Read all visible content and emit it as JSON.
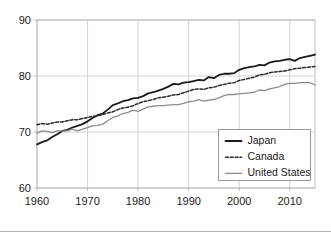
{
  "chart_data": {
    "type": "line",
    "title": "",
    "subtitle": "",
    "xlabel": "",
    "ylabel": "",
    "xlim": [
      1960,
      2015
    ],
    "ylim": [
      60,
      90
    ],
    "xticks": [
      1960,
      1970,
      1980,
      1990,
      2000,
      2010
    ],
    "yticks": [
      60,
      70,
      80,
      90
    ],
    "xtick_labels": [
      "1960",
      "1970",
      "1980",
      "1990",
      "2000",
      "2010"
    ],
    "ytick_labels": [
      "60",
      "70",
      "80",
      "90"
    ],
    "grid": true,
    "grid_axes": "both",
    "legend_position": "lower-right",
    "x": [
      1960,
      1961,
      1962,
      1963,
      1964,
      1965,
      1966,
      1967,
      1968,
      1969,
      1970,
      1971,
      1972,
      1973,
      1974,
      1975,
      1976,
      1977,
      1978,
      1979,
      1980,
      1981,
      1982,
      1983,
      1984,
      1985,
      1986,
      1987,
      1988,
      1989,
      1990,
      1991,
      1992,
      1993,
      1994,
      1995,
      1996,
      1997,
      1998,
      1999,
      2000,
      2001,
      2002,
      2003,
      2004,
      2005,
      2006,
      2007,
      2008,
      2009,
      2010,
      2011,
      2012,
      2013,
      2014,
      2015
    ],
    "series": [
      {
        "name": "Japan",
        "style": "solid",
        "color": "#1a1a1a",
        "width": 1.8,
        "values": [
          67.8,
          68.2,
          68.5,
          69.1,
          69.6,
          70.2,
          70.4,
          70.8,
          71.1,
          71.4,
          71.9,
          72.5,
          73.0,
          73.3,
          74.0,
          74.8,
          75.1,
          75.5,
          75.7,
          76.0,
          76.1,
          76.4,
          76.9,
          77.1,
          77.4,
          77.7,
          78.1,
          78.6,
          78.5,
          78.8,
          78.9,
          79.1,
          79.3,
          79.2,
          79.8,
          79.6,
          80.2,
          80.4,
          80.4,
          80.5,
          81.1,
          81.4,
          81.6,
          81.7,
          82.0,
          81.9,
          82.4,
          82.6,
          82.7,
          82.9,
          83.0,
          82.7,
          83.2,
          83.4,
          83.6,
          83.8
        ]
      },
      {
        "name": "Canada",
        "style": "dashed",
        "color": "#2b2b2b",
        "width": 1.5,
        "values": [
          71.3,
          71.5,
          71.4,
          71.6,
          71.8,
          71.8,
          72.0,
          72.2,
          72.2,
          72.4,
          72.6,
          72.8,
          72.9,
          73.1,
          73.4,
          73.6,
          74.0,
          74.3,
          74.4,
          74.7,
          75.1,
          75.4,
          75.6,
          75.8,
          76.1,
          76.2,
          76.4,
          76.6,
          76.7,
          77.0,
          77.3,
          77.6,
          77.7,
          77.6,
          77.9,
          78.0,
          78.3,
          78.5,
          78.7,
          78.8,
          79.2,
          79.4,
          79.6,
          79.8,
          80.2,
          80.3,
          80.6,
          80.7,
          80.8,
          80.9,
          81.1,
          81.3,
          81.4,
          81.5,
          81.6,
          81.7
        ]
      },
      {
        "name": "United States",
        "style": "solid",
        "color": "#8c8c8c",
        "width": 1.3,
        "values": [
          69.8,
          70.2,
          70.1,
          69.9,
          70.2,
          70.2,
          70.2,
          70.5,
          70.2,
          70.5,
          70.8,
          71.1,
          71.2,
          71.4,
          72.0,
          72.6,
          72.9,
          73.3,
          73.5,
          73.9,
          73.7,
          74.1,
          74.5,
          74.6,
          74.7,
          74.7,
          74.8,
          74.9,
          74.9,
          75.1,
          75.4,
          75.5,
          75.8,
          75.5,
          75.7,
          75.8,
          76.1,
          76.5,
          76.7,
          76.7,
          76.8,
          76.9,
          77.0,
          77.1,
          77.5,
          77.4,
          77.7,
          77.9,
          78.1,
          78.5,
          78.7,
          78.7,
          78.8,
          78.8,
          78.8,
          78.4
        ]
      }
    ]
  },
  "legend": {
    "items": [
      {
        "label": "Japan",
        "swatch": "solid-thick-black"
      },
      {
        "label": "Canada",
        "swatch": "dashed-black"
      },
      {
        "label": "United States",
        "swatch": "solid-thin-gray"
      }
    ]
  }
}
